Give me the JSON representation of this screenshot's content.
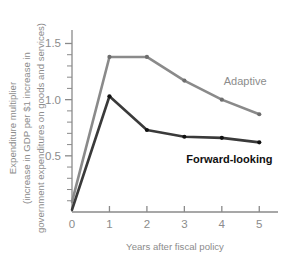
{
  "chart_data": {
    "type": "line",
    "title": "",
    "xlabel": "Years after fiscal policy",
    "ylabel_lines": [
      "Expenditure multiplier",
      "(increase in GDP per $1 increase in",
      "government expenditures on goods and services)"
    ],
    "x": [
      0,
      1,
      2,
      3,
      4,
      5
    ],
    "xlim": [
      0,
      5.5
    ],
    "ylim": [
      0,
      1.62
    ],
    "xticks": [
      0,
      1,
      2,
      3,
      4,
      5
    ],
    "xticklabels": [
      "0",
      "1",
      "2",
      "3",
      "4",
      "5"
    ],
    "yticks_major": [
      0.5,
      1.0,
      1.5
    ],
    "yticklabels": [
      "0.5",
      "1.0",
      "1.5"
    ],
    "yticks_minor": [
      0.1,
      0.2,
      0.3,
      0.4,
      0.6,
      0.7,
      0.8,
      0.9,
      1.1,
      1.2,
      1.3,
      1.4
    ],
    "grid": false,
    "legend_position": "inline-annotations",
    "series": [
      {
        "name": "Adaptive",
        "color": "#8a8a8a",
        "marker_color": "#6e6e6e",
        "label_x": 4.05,
        "label_y": 1.13,
        "values": [
          0.09,
          1.38,
          1.38,
          1.17,
          1.0,
          0.87
        ]
      },
      {
        "name": "Forward-looking",
        "color": "#3a3a3a",
        "marker_color": "#111111",
        "label_x": 3.05,
        "label_y": 0.44,
        "values": [
          0.02,
          1.03,
          0.73,
          0.67,
          0.66,
          0.62
        ]
      }
    ]
  },
  "colors": {
    "background": "#ffffff",
    "axis": "#8a8a8a",
    "tick_text": "#8c8c8c",
    "adaptive": "#8a8a8a",
    "forward_looking": "#3a3a3a"
  }
}
